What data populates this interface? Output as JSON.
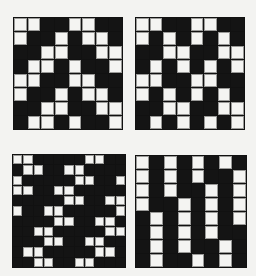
{
  "figure": {
    "background": "#f3f3f1",
    "colors": {
      "black": "#141414",
      "white": "#f4f4f2"
    },
    "panels": [
      {
        "id": "top-left",
        "name": "diagonal-twill-pattern",
        "rows": 8,
        "cols": 8,
        "cells": [
          "WWBBWWBB",
          "WBBWBWWB",
          "BBWWBBWW",
          "BWWBWBBW",
          "WWBBWWBB",
          "WBBWBWWB",
          "BBWWBBWW",
          "BWWBWBBW"
        ]
      },
      {
        "id": "top-right",
        "name": "alternating-block-pattern",
        "rows": 8,
        "cols": 8,
        "cells": [
          "WWBBWWBB",
          "WBWBWBWB",
          "BBWWBBWW",
          "BWBWBWBW",
          "WWBBWWBB",
          "WBWBWBWB",
          "BBWWBBWW",
          "BWBWBWBW"
        ]
      },
      {
        "id": "bottom-left",
        "name": "scattered-pair-pattern",
        "rows": 11,
        "cols": 11,
        "cells": [
          "WWBBBBBWWBB",
          "BWWBBWWBBBB",
          "WBBBBBWWBBW",
          "WWBBWWBBBBB",
          "BBBBBWWBBWW",
          "WBBWWBBBBBW",
          "BBBBWWBBWWB",
          "BBWWBBBBBWW",
          "BBBWWBBWWBB",
          "BWWBBBBBWWB",
          "BBWWBBWWBBB"
        ]
      },
      {
        "id": "bottom-right",
        "name": "staircase-stripe-pattern",
        "rows": 8,
        "cols": 8,
        "cells": [
          "WBWBWBWB",
          "WBWBWBBW",
          "WBWBBWBW",
          "WBBWBWBW",
          "BWBWBWBW",
          "BWBWBWBB",
          "BWBWBBWB",
          "BWBBWBWB"
        ]
      }
    ]
  }
}
